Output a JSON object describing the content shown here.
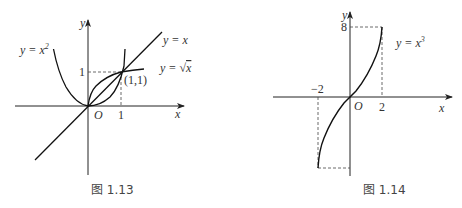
{
  "figures": [
    {
      "caption": "图 1.13",
      "axes": {
        "x_label": "x",
        "y_label": "y",
        "origin_label": "O"
      },
      "ticks": {
        "x": "1",
        "y": "1"
      },
      "point_label": "(1,1)",
      "curves": [
        {
          "label": "y = x²",
          "label_main": "y = x",
          "label_sup": "2"
        },
        {
          "label": "y = x"
        },
        {
          "label": "y = √x",
          "label_main": "y = ",
          "label_rad": "x"
        }
      ]
    },
    {
      "caption": "图 1.14",
      "axes": {
        "x_label": "x",
        "y_label": "y",
        "origin_label": "O"
      },
      "ticks": {
        "x_pos": "2",
        "x_neg": "−2",
        "y": "8"
      },
      "curves": [
        {
          "label": "y = x³",
          "label_main": "y = x",
          "label_sup": "3"
        }
      ]
    }
  ],
  "colors": {
    "stroke": "#1a1a1a",
    "text": "#333333"
  }
}
